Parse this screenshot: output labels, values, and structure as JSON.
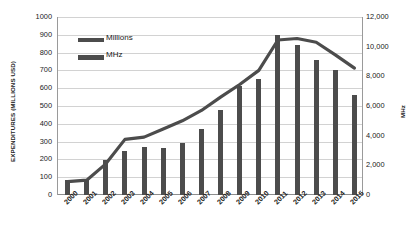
{
  "chart_data": {
    "type": "bar",
    "title": "",
    "subtitle": "",
    "xlabel": "",
    "ylabel": "EXPENDITURES (MILLIONS USD)",
    "y2label": "MHz",
    "grid": true,
    "legend_position": "top-left",
    "categories": [
      "2000",
      "2001",
      "2002",
      "2003",
      "2004",
      "2005",
      "2006",
      "2007",
      "2008",
      "2009",
      "2010",
      "2011",
      "2012",
      "2013",
      "2014",
      "2015"
    ],
    "ylim": [
      0,
      1000
    ],
    "y2lim": [
      0,
      12000
    ],
    "yticks": [
      "0",
      "100",
      "200",
      "300",
      "400",
      "500",
      "600",
      "700",
      "800",
      "900",
      "1000"
    ],
    "y2ticks": [
      "0",
      "2,000",
      "4,000",
      "6,000",
      "8,000",
      "10,000",
      "12,000"
    ],
    "series": [
      {
        "name": "Millions",
        "type": "bar",
        "axis": "left",
        "color": "#4c4c4c",
        "values": [
          85,
          85,
          195,
          245,
          270,
          263,
          293,
          370,
          480,
          610,
          650,
          900,
          845,
          760,
          700,
          560
        ]
      },
      {
        "name": "MHz",
        "type": "line",
        "axis": "right",
        "color": "#4c4c4c",
        "values": [
          900,
          1000,
          2100,
          3750,
          3900,
          4450,
          5000,
          5700,
          6600,
          7450,
          8400,
          10450,
          10550,
          10300,
          9450,
          8550
        ]
      }
    ]
  },
  "legend": {
    "items": [
      {
        "label": "Millions",
        "marker": "bar-swatch"
      },
      {
        "label": "MHz",
        "marker": "line-swatch"
      }
    ]
  },
  "axes": {
    "left_title": "EXPENDITURES (MILLIONS USD)",
    "right_title": "MHz"
  }
}
